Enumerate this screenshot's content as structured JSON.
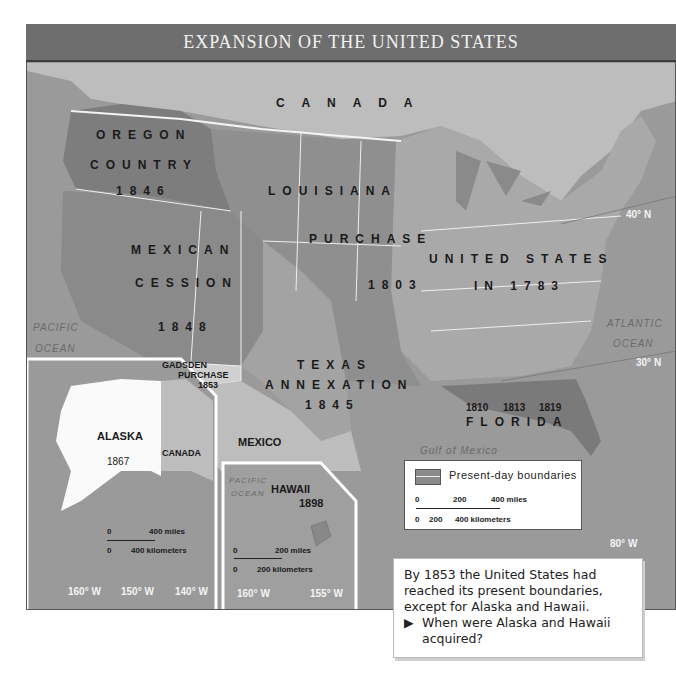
{
  "title": "EXPANSION OF THE UNITED STATES",
  "regions": {
    "canada": "C A N A D A",
    "oregon": [
      "OREGON",
      "COUNTRY",
      "1846"
    ],
    "louisiana": [
      "LOUISIANA",
      "PURCHASE",
      "1803"
    ],
    "mexican_cession": [
      "MEXICAN",
      "CESSION",
      "1848"
    ],
    "united_states": [
      "UNITED STATES",
      "IN 1783"
    ],
    "texas": [
      "TEXAS",
      "ANNEXATION",
      "1845"
    ],
    "gadsden": [
      "GADSDEN",
      "PURCHASE",
      "1853"
    ],
    "florida": "FLORIDA",
    "florida_years": [
      "1810",
      "1813",
      "1819"
    ],
    "mexico": "MEXICO"
  },
  "water": {
    "pacific": [
      "PACIFIC",
      "OCEAN"
    ],
    "atlantic": [
      "ATLANTIC",
      "OCEAN"
    ],
    "gulf": "Gulf of Mexico"
  },
  "latitudes": {
    "n40": "40° N",
    "n30": "30° N"
  },
  "longitudes": {
    "w80": "80° W"
  },
  "alaska_inset": {
    "name": "ALASKA",
    "year": "1867",
    "canada": "CANADA",
    "scale_miles": [
      "0",
      "400 miles"
    ],
    "scale_km": [
      "0",
      "400 kilometers"
    ],
    "longitudes": [
      "160° W",
      "150° W",
      "140° W"
    ]
  },
  "hawaii_inset": {
    "name": "HAWAII",
    "year": "1898",
    "ocean": [
      "PACIFIC",
      "OCEAN"
    ],
    "scale_miles": [
      "0",
      "200 miles"
    ],
    "scale_km": [
      "0",
      "200 kilometers"
    ],
    "longitudes": [
      "160° W",
      "155° W"
    ]
  },
  "legend": {
    "label": "Present-day boundaries",
    "miles": [
      "0",
      "200",
      "400 miles"
    ],
    "km": [
      "0",
      "200",
      "400 kilometers"
    ]
  },
  "caption": {
    "text": "By 1853 the United States had reached its present boundaries, except for Alaska and Hawaii.",
    "question": "When were Alaska and Hawaii acquired?"
  },
  "colors": {
    "title_bar": "#6e6e6e",
    "ocean": "#9a9a9a",
    "canada_mexico": "#bdbdbd",
    "us_1783": "#a9a9a9",
    "louisiana": "#8f8f8f",
    "oregon": "#7d7d7d",
    "texas": "#a3a3a3",
    "florida": "#7a7a7a"
  }
}
